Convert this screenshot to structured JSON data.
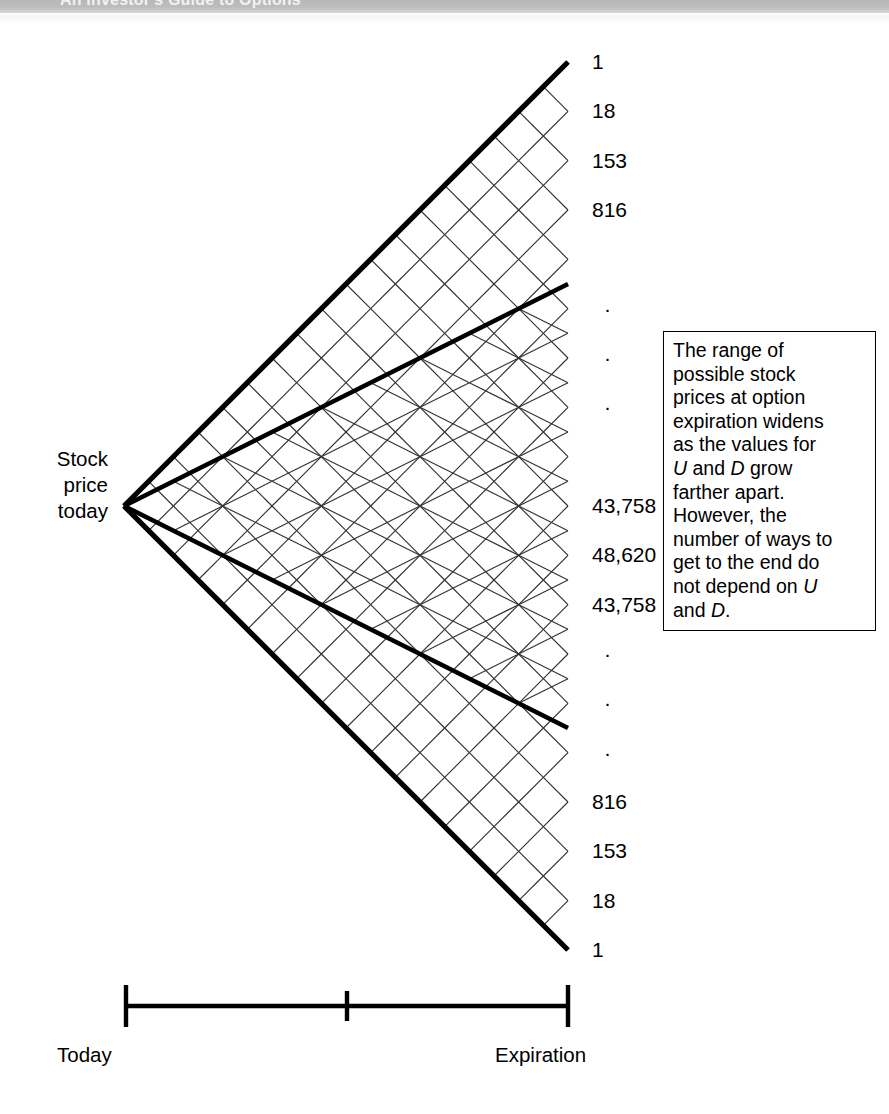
{
  "header": {
    "title": "An Investor's Guide to Options",
    "band_color": "#bdbdbd"
  },
  "figure": {
    "left_label": "Stock\nprice\ntoday",
    "left_label_lines": [
      "Stock",
      "price",
      "today"
    ],
    "axis": {
      "start_label": "Today",
      "end_label": "Expiration",
      "tick_count": 3
    },
    "callout": {
      "line1": "The range of",
      "line2": "possible stock",
      "line3": "prices at option",
      "line4": "expiration widens",
      "line5": "as the values for",
      "line6_pre": "",
      "line6_u": "U",
      "line6_mid": " and ",
      "line6_d": "D",
      "line6_post": " grow",
      "line7": "farther apart.",
      "line8": "However, the",
      "line9": "number of ways to",
      "line10": "get to the end do",
      "line11_pre": "not depend on ",
      "line11_u": "U",
      "line12_pre": "and ",
      "line12_d": "D",
      "line12_post": "."
    }
  },
  "chart_data": {
    "type": "diagram",
    "subtype": "binomial-lattice",
    "steps": 18,
    "inner_steps": 9,
    "xlabel": "",
    "ylabel": "",
    "axis_ticks": [
      "Today",
      "",
      "Expiration"
    ],
    "terminal_labels": [
      {
        "index": 0,
        "text": "1",
        "kind": "value"
      },
      {
        "index": 1,
        "text": "18",
        "kind": "value"
      },
      {
        "index": 2,
        "text": "153",
        "kind": "value"
      },
      {
        "index": 3,
        "text": "816",
        "kind": "value"
      },
      {
        "index": 4,
        "text": "",
        "kind": "blank"
      },
      {
        "index": 5,
        "text": "·",
        "kind": "dot"
      },
      {
        "index": 6,
        "text": "·",
        "kind": "dot"
      },
      {
        "index": 7,
        "text": "·",
        "kind": "dot"
      },
      {
        "index": 8,
        "text": "",
        "kind": "blank"
      },
      {
        "index": 9,
        "text": "43,758",
        "kind": "value"
      },
      {
        "index": 10,
        "text": "48,620",
        "kind": "value"
      },
      {
        "index": 11,
        "text": "43,758",
        "kind": "value"
      },
      {
        "index": 12,
        "text": "·",
        "kind": "dot"
      },
      {
        "index": 13,
        "text": "·",
        "kind": "dot"
      },
      {
        "index": 14,
        "text": "·",
        "kind": "dot"
      },
      {
        "index": 15,
        "text": "816",
        "kind": "value"
      },
      {
        "index": 16,
        "text": "153",
        "kind": "value"
      },
      {
        "index": 17,
        "text": "18",
        "kind": "value"
      },
      {
        "index": 18,
        "text": "1",
        "kind": "value"
      }
    ],
    "binomial_row": "Row 18 of Pascal's triangle: 1, 18, 153, 816, ..., 43758, 48620, 43758, ..., 816, 153, 18, 1",
    "colors": {
      "stroke": "#1a1a1a",
      "bold_stroke": "#000000",
      "fill": "#ffffff"
    }
  }
}
